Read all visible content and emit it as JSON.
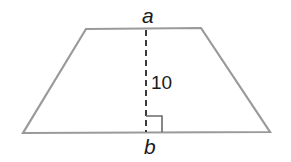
{
  "figure": {
    "type": "trapezoid",
    "colors": {
      "outline": "#9a9a9a",
      "height_line": "#3a3a3a",
      "text": "#1a1a1a",
      "background": "#ffffff"
    },
    "vertices": {
      "top_left": [
        86,
        29
      ],
      "top_right": [
        201,
        28
      ],
      "bottom_right": [
        270,
        132
      ],
      "bottom_left": [
        23,
        133
      ]
    },
    "labels": {
      "top_base": "a",
      "bottom_base": "b",
      "height": "10"
    },
    "height_segment": {
      "style": "dashed",
      "from": [
        146,
        29
      ],
      "to": [
        146,
        132
      ]
    },
    "right_angle_marker": true
  }
}
